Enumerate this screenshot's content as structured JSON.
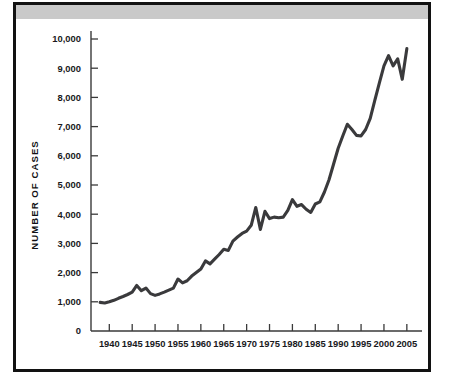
{
  "figure": {
    "background_color": "#ffffff",
    "frame_color": "#121212",
    "band_color": "#c9c9c9",
    "line_color": "#3a3a3c"
  },
  "chart_data": {
    "type": "line",
    "title": "",
    "subtitle": "",
    "xlabel": "",
    "ylabel": "NUMBER OF CASES",
    "xlim": [
      1936,
      2007
    ],
    "ylim": [
      0,
      10000
    ],
    "grid": false,
    "legend": null,
    "legend_position": "none",
    "y_ticks": [
      0,
      1000,
      2000,
      3000,
      4000,
      5000,
      6000,
      7000,
      8000,
      9000,
      10000
    ],
    "y_tick_labels": [
      "0",
      "1,000",
      "2,000",
      "3,000",
      "4,000",
      "5,000",
      "6,000",
      "7,000",
      "8,000",
      "9,000",
      "10,000"
    ],
    "x_ticks": [
      1940,
      1945,
      1950,
      1955,
      1960,
      1965,
      1970,
      1975,
      1980,
      1985,
      1990,
      1995,
      2000,
      2005
    ],
    "x_tick_labels": [
      "1940",
      "1945",
      "1950",
      "1955",
      "1960",
      "1965",
      "1970",
      "1975",
      "1980",
      "1985",
      "1990",
      "1995",
      "2000",
      "2005"
    ],
    "series": [
      {
        "name": "Number of cases",
        "x": [
          1938,
          1939,
          1940,
          1941,
          1942,
          1943,
          1944,
          1945,
          1946,
          1947,
          1948,
          1949,
          1950,
          1951,
          1952,
          1953,
          1954,
          1955,
          1956,
          1957,
          1958,
          1959,
          1960,
          1961,
          1962,
          1963,
          1964,
          1965,
          1966,
          1967,
          1968,
          1969,
          1970,
          1971,
          1972,
          1973,
          1974,
          1975,
          1976,
          1977,
          1978,
          1979,
          1980,
          1981,
          1982,
          1983,
          1984,
          1985,
          1986,
          1987,
          1988,
          1989,
          1990,
          1991,
          1992,
          1993,
          1994,
          1995,
          1996,
          1997,
          1998,
          1999,
          2000,
          2001,
          2002,
          2003,
          2004,
          2005
        ],
        "y": [
          980,
          960,
          1000,
          1050,
          1120,
          1180,
          1250,
          1330,
          1560,
          1380,
          1470,
          1280,
          1220,
          1270,
          1330,
          1400,
          1470,
          1780,
          1650,
          1720,
          1880,
          2000,
          2120,
          2400,
          2300,
          2460,
          2620,
          2800,
          2760,
          3080,
          3220,
          3340,
          3420,
          3620,
          4230,
          3480,
          4100,
          3850,
          3900,
          3880,
          3900,
          4130,
          4500,
          4270,
          4330,
          4170,
          4060,
          4350,
          4420,
          4760,
          5180,
          5720,
          6260,
          6680,
          7080,
          6900,
          6700,
          6680,
          6900,
          7280,
          7900,
          8500,
          9080,
          9430,
          9080,
          9320,
          8620,
          9670
        ],
        "color": "#3a3a3c"
      }
    ],
    "annotations": []
  }
}
